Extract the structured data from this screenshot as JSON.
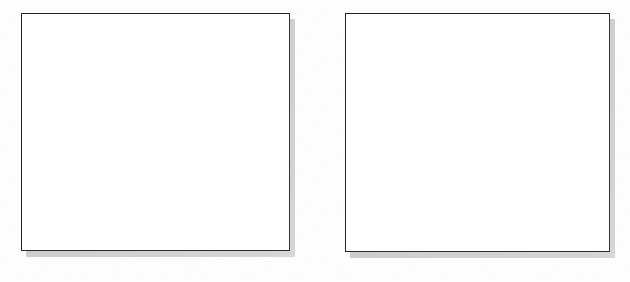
{
  "page": {
    "width": 630,
    "height": 282,
    "background_color": "#fdfdfd",
    "text_content": "",
    "visible_labels": []
  },
  "style": {
    "border_color": "#232323",
    "box_fill_color": "#ffffff",
    "shadow_color": "#c9c9c9",
    "paper_color": "#fdfdfd",
    "shadow_offset_x": 5,
    "shadow_offset_y": 6,
    "border_width": 1.6
  },
  "boxes": [
    {
      "id": "left-box",
      "label": "",
      "content": "",
      "x": 21,
      "y": 13,
      "width": 269,
      "height": 238,
      "empty": true
    },
    {
      "id": "right-box",
      "label": "",
      "content": "",
      "x": 345,
      "y": 13,
      "width": 265,
      "height": 239,
      "empty": true
    }
  ]
}
